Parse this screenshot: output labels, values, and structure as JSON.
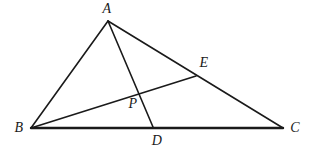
{
  "figure": {
    "type": "geometry-diagram",
    "background_color": "#ffffff",
    "stroke_color": "#1a1a1a",
    "label_color": "#1a1a1a",
    "width": 315,
    "height": 152,
    "points": {
      "A": {
        "label": "A",
        "x": 108,
        "y": 21,
        "label_x": 107,
        "label_y": 9
      },
      "B": {
        "label": "B",
        "x": 31,
        "y": 128,
        "label_x": 19,
        "label_y": 128
      },
      "C": {
        "label": "C",
        "x": 283,
        "y": 128,
        "label_x": 295,
        "label_y": 128
      },
      "D": {
        "label": "D",
        "x": 153,
        "y": 127,
        "label_x": 157,
        "label_y": 141
      },
      "E": {
        "label": "E",
        "x": 196,
        "y": 76,
        "label_x": 204,
        "label_y": 63
      },
      "P": {
        "label": "P",
        "x": 138,
        "y": 92,
        "label_x": 133,
        "label_y": 104
      }
    },
    "segments": [
      {
        "name": "side-ab",
        "from": "A",
        "to": "B",
        "width": 1.6
      },
      {
        "name": "side-ac",
        "from": "A",
        "to": "C",
        "width": 1.6
      },
      {
        "name": "side-bc",
        "from": "B",
        "to": "C",
        "width": 2.4
      },
      {
        "name": "cevian-ad",
        "from": "A",
        "to": "D",
        "width": 1.6
      },
      {
        "name": "cevian-be",
        "from": "B",
        "to": "E",
        "width": 1.6
      }
    ]
  }
}
